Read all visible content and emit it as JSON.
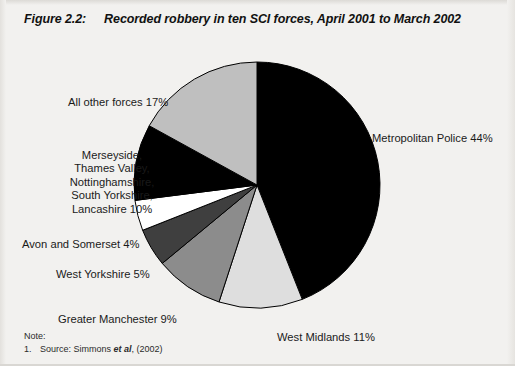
{
  "figure": {
    "number": "Figure 2.2:",
    "title": "Recorded robbery in ten SCI forces, April 2001 to March 2002"
  },
  "note": {
    "heading": "Note:",
    "items": [
      {
        "number": "1.",
        "text_before": "Source: Simmons ",
        "text_italic": "et al",
        "text_after": ", (2002)"
      }
    ]
  },
  "labels": {
    "metropolitan": "Metropolitan Police 44%",
    "all_other": "All other forces 17%",
    "merseyside_group": "Merseyside,\nThames Valley,\nNottinghamshire,\nSouth Yorkshire,\nLancashire 10%",
    "avon": "Avon and Somerset 4%",
    "west_yorkshire": "West Yorkshire 5%",
    "greater_manchester": "Greater Manchester 9%",
    "west_midlands": "West Midlands 11%"
  },
  "chart_data": {
    "type": "pie",
    "title": "Recorded robbery in ten SCI forces, April 2001 to March 2002",
    "unit": "percent",
    "total": 100,
    "start_angle_deg": 0,
    "direction": "clockwise",
    "legend": "none (labels placed outside slices)",
    "categories": [
      "Metropolitan Police",
      "West Midlands",
      "Greater Manchester",
      "West Yorkshire",
      "Avon and Somerset",
      "Merseyside, Thames Valley, Nottinghamshire, South Yorkshire, Lancashire",
      "All other forces"
    ],
    "values": [
      44,
      11,
      9,
      5,
      4,
      10,
      17
    ],
    "labels": [
      "Metropolitan Police 44%",
      "West Midlands 11%",
      "Greater Manchester 9%",
      "West Yorkshire 5%",
      "Avon and Somerset 4%",
      "Merseyside, Thames Valley, Nottinghamshire, South Yorkshire, Lancashire 10%",
      "All other forces 17%"
    ],
    "colors": [
      "#000000",
      "#dedede",
      "#8c8c8c",
      "#3f3f3f",
      "#ffffff",
      "#000000",
      "#bfbfbf"
    ],
    "stroke": "#000000",
    "geometry": {
      "cx": 257,
      "cy": 155,
      "r": 123
    }
  }
}
